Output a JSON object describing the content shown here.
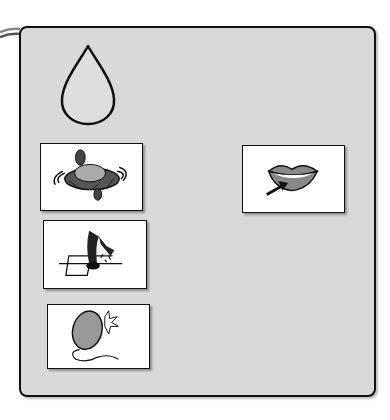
{
  "board": {
    "background": "#d9d9d9",
    "border": "#111111",
    "symbol": {
      "icon": "water-drop-icon"
    },
    "cards": [
      {
        "id": "spin",
        "icon": "spinning-top-icon",
        "label": "spinning top"
      },
      {
        "id": "hopscotch",
        "icon": "hopscotch-icon",
        "label": "hopscotch"
      },
      {
        "id": "balloon",
        "icon": "popping-balloon-icon",
        "label": "balloon pop"
      },
      {
        "id": "lips",
        "icon": "lips-pointer-icon",
        "label": "lips"
      }
    ]
  }
}
